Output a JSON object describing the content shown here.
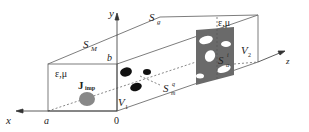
{
  "figure": {
    "colors": {
      "line": "#6e6e6e",
      "panel": "#6a6a6a",
      "hole": "#ffffff",
      "scatterer": "#111111",
      "source": "#888888",
      "text": "#222222"
    }
  },
  "axes": {
    "x": "x",
    "y": "y",
    "z": "z",
    "origin": "0",
    "a": "a",
    "b": "b"
  },
  "labels": {
    "surface_metal": "S",
    "surface_metal_sub": "M",
    "surface_grating": "S",
    "surface_grating_sub": "g",
    "interface": "S",
    "interface_sub": "α",
    "interface_sup": "i",
    "scatterer": "S",
    "scatterer_sub": "m",
    "scatterer_sup": "q",
    "volume1": "V",
    "volume1_sub": "1",
    "volume2": "V",
    "volume2_sub": "2",
    "medium_front": "ε,μ",
    "medium_back": "ε,μ",
    "source": "J",
    "source_sub": "imp"
  }
}
